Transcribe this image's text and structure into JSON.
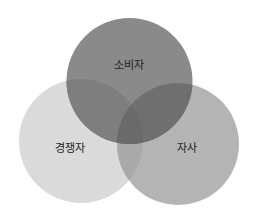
{
  "diagram": {
    "type": "venn-3",
    "circles": [
      {
        "id": "top",
        "label": "소비자",
        "cx": 129.5,
        "cy": 81,
        "r": 63,
        "color": "#8a8a8a"
      },
      {
        "id": "left",
        "label": "경쟁자",
        "cx": 81,
        "cy": 141,
        "r": 62,
        "color": "#dadada"
      },
      {
        "id": "right",
        "label": "자사",
        "cx": 178,
        "cy": 144,
        "r": 61,
        "color": "#b4b4b4"
      }
    ],
    "overlaps": {
      "top_left": "#7e7e7e",
      "top_right": "#6f6f6f",
      "left_right": "#a9a9a9",
      "all": "#6a6a6a"
    },
    "labels": {
      "top": "소비자",
      "left": "경쟁자",
      "right": "자사"
    }
  }
}
